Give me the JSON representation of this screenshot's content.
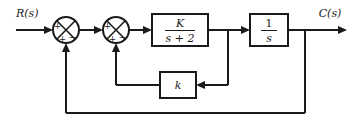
{
  "diagram": {
    "type": "control-system-block-diagram",
    "title": "",
    "stroke_color": "#1a1a1a",
    "fill_color": "#ffffff",
    "background": "#ffffff",
    "input": {
      "label": "R(s)",
      "name": "reference-input"
    },
    "output": {
      "label": "C(s)",
      "name": "controlled-output"
    },
    "summing_junctions": [
      {
        "id": "sum1",
        "name": "outer-summing-junction",
        "signs": {
          "left": "+",
          "bottom": "+",
          "right": "−"
        },
        "cx": 66,
        "cy": 30,
        "r": 13
      },
      {
        "id": "sum2",
        "name": "inner-summing-junction",
        "signs": {
          "left": "+",
          "bottom": "+",
          "right": "−"
        },
        "cx": 116,
        "cy": 30,
        "r": 13
      }
    ],
    "blocks": [
      {
        "id": "plant",
        "name": "forward-gain-block",
        "numerator": "K",
        "denominator": "s + 2",
        "x": 152,
        "y": 14,
        "w": 56,
        "h": 32
      },
      {
        "id": "integrator",
        "name": "integrator-block",
        "numerator": "1",
        "denominator": "s",
        "x": 250,
        "y": 14,
        "w": 38,
        "h": 32
      },
      {
        "id": "rate-gain",
        "name": "inner-feedback-gain-block",
        "label": "k",
        "x": 160,
        "y": 72,
        "w": 36,
        "h": 26
      }
    ],
    "signal_paths": [
      {
        "name": "input-path",
        "from": "R(s)",
        "to": "sum1"
      },
      {
        "name": "sum1-to-sum2",
        "from": "sum1",
        "to": "sum2"
      },
      {
        "name": "sum2-to-plant",
        "from": "sum2",
        "to": "plant"
      },
      {
        "name": "plant-to-integrator",
        "from": "plant",
        "to": "integrator"
      },
      {
        "name": "integrator-to-output",
        "from": "integrator",
        "to": "C(s)"
      },
      {
        "name": "inner-feedback-path",
        "from": "plant-output-tap",
        "to": "rate-gain"
      },
      {
        "name": "inner-feedback-return",
        "from": "rate-gain",
        "to": "sum2"
      },
      {
        "name": "outer-feedback-path",
        "from": "output-tap",
        "to": "sum1"
      }
    ]
  }
}
